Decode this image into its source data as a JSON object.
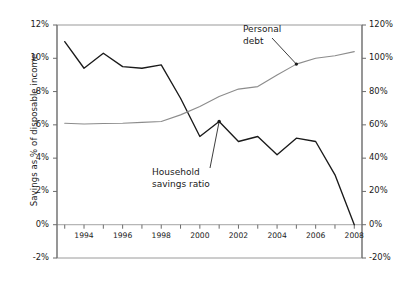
{
  "chart_data": {
    "type": "line",
    "title": "",
    "xlabel": "",
    "x": [
      1993,
      1994,
      1995,
      1996,
      1997,
      1998,
      1999,
      2000,
      2001,
      2002,
      2003,
      2004,
      2005,
      2006,
      2007,
      2008
    ],
    "xlim": [
      1992.6,
      2008.4
    ],
    "xticks_labeled": [
      "1994",
      "1996",
      "1998",
      "2000",
      "2002",
      "2004",
      "2006",
      "2008"
    ],
    "xticks_labeled_values": [
      1994,
      1996,
      1998,
      2000,
      2002,
      2004,
      2006,
      2008
    ],
    "grid": false,
    "legend_position": "inline-annotations",
    "axes": [
      {
        "id": "left",
        "label": "Savings as % of disposable income",
        "ylim": [
          -2,
          12
        ],
        "ticks": [
          -2,
          0,
          2,
          4,
          6,
          8,
          10,
          12
        ],
        "tick_labels": [
          "-2%",
          "0%",
          "2%",
          "4%",
          "6%",
          "8%",
          "10%",
          "12%"
        ]
      },
      {
        "id": "right",
        "label": "Personal debt as % of GDP",
        "ylim": [
          -20,
          120
        ],
        "ticks": [
          -20,
          0,
          20,
          40,
          60,
          80,
          100,
          120
        ],
        "tick_labels": [
          "-20%",
          "0%",
          "20%",
          "40%",
          "60%",
          "80%",
          "100%",
          "120%"
        ]
      }
    ],
    "series": [
      {
        "name": "Household savings ratio",
        "axis": "left",
        "color": "#1a1a1a",
        "units": "% of disposable income",
        "values": [
          11.0,
          9.4,
          10.3,
          9.5,
          9.4,
          9.6,
          7.6,
          5.3,
          6.2,
          5.0,
          5.3,
          4.2,
          5.2,
          5.0,
          3.0,
          0.0
        ]
      },
      {
        "name": "Personal debt",
        "axis": "right",
        "color": "#8c8c8c",
        "units": "% of GDP",
        "values": [
          61.0,
          60.5,
          60.8,
          61.0,
          61.5,
          62.0,
          66.0,
          71.0,
          77.0,
          81.5,
          83.0,
          90.0,
          96.5,
          100.0,
          101.5,
          104.0
        ]
      }
    ],
    "annotations": [
      {
        "id": "personal-debt",
        "text_lines": [
          "Personal",
          "debt"
        ],
        "points_to_year": 2005,
        "points_to_value": 96.5,
        "axis": "right"
      },
      {
        "id": "household-savings-ratio",
        "text_lines": [
          "Household",
          "savings ratio"
        ],
        "points_to_year": 2001,
        "points_to_value": 6.2,
        "axis": "left"
      }
    ]
  },
  "axis_titles": {
    "left": "Savings as % of disposable income",
    "right": "Personal debt as % of GDP"
  },
  "annotations": {
    "debt_line1": "Personal",
    "debt_line2": "debt",
    "savings_line1": "Household",
    "savings_line2": "savings ratio"
  },
  "colors": {
    "savings_line": "#1a1a1a",
    "debt_line": "#8c8c8c",
    "frame": "#9a9a9a",
    "axis": "#6b6b6b",
    "text": "#1a1a1a",
    "background": "#ffffff"
  }
}
